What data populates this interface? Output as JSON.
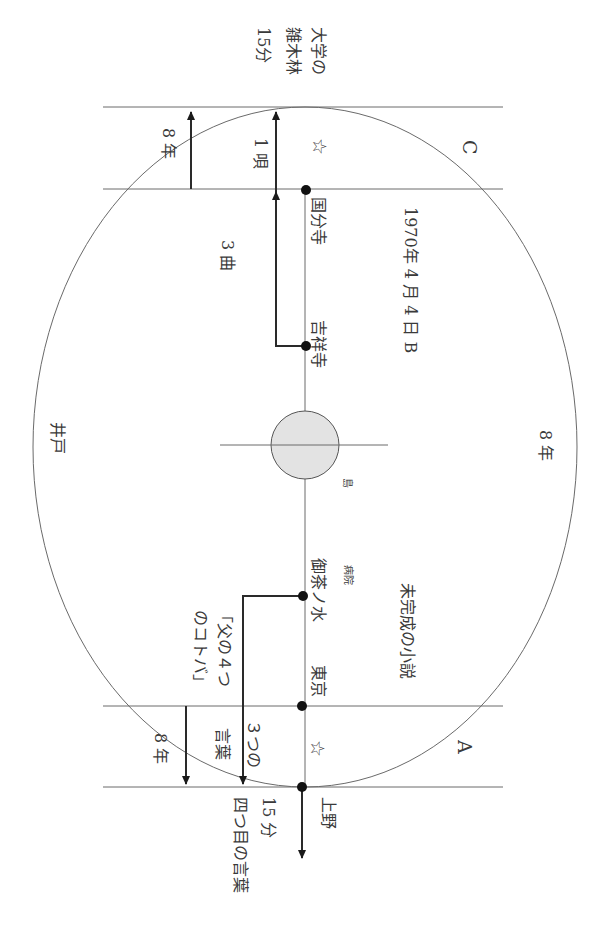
{
  "diagram": {
    "orientation": "rotated 90° clockwise; text reads top-to-bottom",
    "colors": {
      "line": "#6a6a6a",
      "path": "#2a2a2a",
      "island_fill": "#e3e3e3",
      "dot": "#111111"
    },
    "region_labels": {
      "c": "C",
      "b_date": "1970年 4 月 4 日 B",
      "a": "A"
    },
    "stations": {
      "kokubunji": "国分寺",
      "kichijoji": "吉祥寺",
      "ochanomizu": "御茶ノ水",
      "tokyo": "東京",
      "ueno": "上野"
    },
    "annotations": {
      "top_dest_line1": "大学の",
      "top_dest_line2": "雑木林",
      "top_dest_line3": "15分",
      "eight_years_top": "8 年",
      "one_song": "1 唄",
      "three_songs": "3 曲",
      "eight_years_right": "8 年",
      "well": "井戸",
      "island": "島",
      "hospital": "病院",
      "unfinished_novel": "未完成の小説",
      "fathers_words_line1": "「父の４つ",
      "fathers_words_line2": "のコトバ」",
      "three_words_line1": "３つの",
      "three_words_line2": "言葉",
      "eight_years_bottom": "8 年",
      "fifteen_min": "15 分",
      "fourth_word": "四つ目の言葉",
      "star_top": "☆",
      "star_bottom": "☆"
    }
  }
}
